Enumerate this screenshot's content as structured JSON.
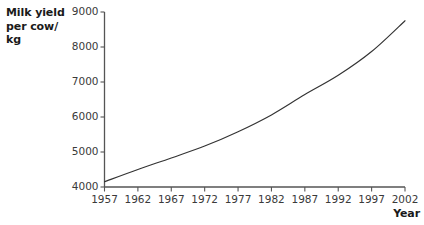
{
  "chart_data": {
    "type": "line",
    "title": "",
    "xlabel": "Year",
    "ylabel": "Milk yield per cow/ kg",
    "ylabel_lines": [
      "Milk yield",
      "per cow/",
      "kg"
    ],
    "xlim": [
      1957,
      2002
    ],
    "ylim": [
      4000,
      9000
    ],
    "xticks": [
      1957,
      1962,
      1967,
      1972,
      1977,
      1982,
      1987,
      1992,
      1997,
      2002
    ],
    "xtick_labels": [
      "1957",
      "1962",
      "1967",
      "1972",
      "1977",
      "1982",
      "1987",
      "1992",
      "1997",
      "2002"
    ],
    "yticks": [
      4000,
      5000,
      6000,
      7000,
      8000,
      9000
    ],
    "ytick_labels": [
      "4000",
      "5000",
      "6000",
      "7000",
      "8000",
      "9000"
    ],
    "grid": false,
    "legend": false,
    "legend_position": "none",
    "line_color": "#333333",
    "axis_color": "#555555",
    "background_color": "#ffffff",
    "series": [
      {
        "name": "Milk yield per cow",
        "x": [
          1957,
          1962,
          1967,
          1972,
          1977,
          1982,
          1987,
          1992,
          1997,
          2002
        ],
        "values": [
          4150,
          4500,
          4830,
          5170,
          5580,
          6060,
          6640,
          7190,
          7870,
          8750
        ]
      }
    ]
  },
  "labels": {
    "y_axis_title": "Milk yield per cow/ kg",
    "x_axis_title": "Year"
  }
}
